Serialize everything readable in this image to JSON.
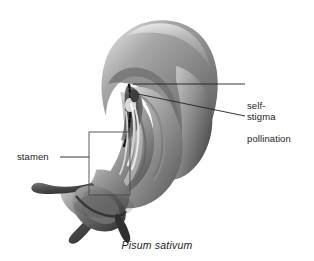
{
  "figure": {
    "domain": "botanical-illustration",
    "caption": "Pisum sativum",
    "background_color": "#ffffff",
    "ink_color": "#1c1c1c",
    "rendering": "grayscale airbrush / pencil shading"
  },
  "callouts": [
    {
      "id": "self-pollination",
      "line1": "self-",
      "line2": "pollination",
      "leader": "horizontal line from label left edge to flower interior",
      "target": "interior of keel where anthers meet stigma"
    },
    {
      "id": "stigma",
      "text": "stigma",
      "leader": "line sloping up-left from label to stigma tip",
      "target": "stigma tip inside keel"
    },
    {
      "id": "stamen",
      "text": "stamen",
      "leader": "horizontal line from label right edge to callout box",
      "target": "boxed region enclosing the stamen filaments"
    }
  ],
  "callout_box": {
    "name": "stamen-callout-box",
    "stroke": "#3a3a3a",
    "fill": "none"
  },
  "palette": {
    "light_petal": "#e9e9e9",
    "mid_petal": "#b9b9b9",
    "shadow_petal": "#7c7c7c",
    "dark_petal": "#4f4f4f",
    "deep_shadow": "#2e2e2e",
    "highlight": "#fbfbfb",
    "line": "#2b2b2b"
  }
}
